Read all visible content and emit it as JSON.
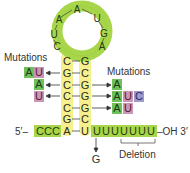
{
  "diagram": {
    "loop": {
      "nucleotides": [
        "U",
        "C",
        "A",
        "A",
        "U",
        "G",
        "A"
      ],
      "left_side": [
        "A",
        "U",
        "C"
      ],
      "top": "A",
      "right_side": [
        "U",
        "G",
        "A"
      ],
      "color": "#a8d64a"
    },
    "stem": {
      "pairs": [
        {
          "left": "C",
          "right": "G"
        },
        {
          "left": "G",
          "right": "C"
        },
        {
          "left": "C",
          "right": "G"
        },
        {
          "left": "C",
          "right": "G"
        },
        {
          "left": "C",
          "right": "G"
        },
        {
          "left": "G",
          "right": "C"
        },
        {
          "left": "A",
          "right": "U"
        }
      ],
      "color": "#f6ef8e"
    },
    "five_prime": {
      "label": "5′–",
      "tail": [
        "C",
        "C",
        "C"
      ],
      "color": "#a8d64a"
    },
    "three_prime": {
      "tail": [
        "U",
        "U",
        "U",
        "U",
        "U",
        "U",
        "U"
      ],
      "label": "–OH 3′",
      "color": "#a8d64a"
    },
    "left_mutations": {
      "title": "Mutations",
      "rows": [
        {
          "target_row": 1,
          "boxes": [
            {
              "text": "A",
              "color": "green"
            },
            {
              "text": "U",
              "color": "pink"
            }
          ]
        },
        {
          "target_row": 2,
          "boxes": [
            {
              "text": "A",
              "color": "green"
            }
          ]
        },
        {
          "target_row": 3,
          "boxes": [
            {
              "text": "U",
              "color": "pink"
            }
          ]
        }
      ]
    },
    "right_mutations": {
      "title": "Mutations",
      "rows": [
        {
          "target_row": 2,
          "boxes": [
            {
              "text": "A",
              "color": "green"
            }
          ]
        },
        {
          "target_row": 3,
          "boxes": [
            {
              "text": "A",
              "color": "green"
            },
            {
              "text": "U",
              "color": "pink"
            },
            {
              "text": "C",
              "color": "purple"
            }
          ]
        },
        {
          "target_row": 4,
          "boxes": [
            {
              "text": "A",
              "color": "green"
            },
            {
              "text": "U",
              "color": "pink"
            }
          ]
        }
      ]
    },
    "point_mutation": {
      "from": "U",
      "to": "G"
    },
    "deletion": {
      "label": "Deletion"
    },
    "colors": {
      "green_box": "#6fbf5a",
      "pink_box": "#c996b4",
      "purple_box": "#9f98c8",
      "loop_green": "#a8d64a",
      "stem_yellow": "#f6ef8e"
    }
  }
}
